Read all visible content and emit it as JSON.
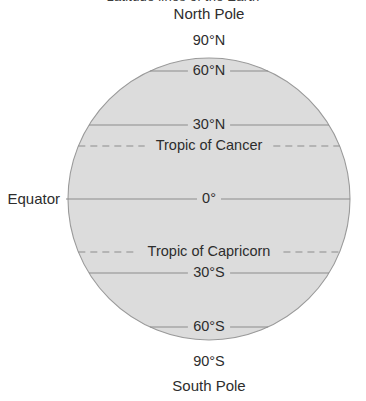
{
  "figure": {
    "cut_off_title": "Latitude lines of the Earth",
    "globe": {
      "fill_color": "#dcdcdc",
      "outline_color": "#9a9a9a",
      "center_x": 209,
      "center_y": 199,
      "radius": 141
    },
    "line_color": "#8c8c8c",
    "text_color": "#2d2d2d"
  },
  "labels": {
    "north_pole": "North Pole",
    "south_pole": "South Pole",
    "equator_side": "Equator"
  },
  "chart_data": {
    "type": "diagram",
    "title": "Latitude lines of the Earth",
    "latitudes": [
      {
        "name": "90N",
        "label": "90°N",
        "y": 41,
        "style": "none",
        "position": "above-globe",
        "degrees": 90
      },
      {
        "name": "60N",
        "label": "60°N",
        "y": 71,
        "style": "solid",
        "position": "inside",
        "degrees": 60
      },
      {
        "name": "30N",
        "label": "30°N",
        "y": 125,
        "style": "solid",
        "position": "inside",
        "degrees": 30
      },
      {
        "name": "cancer",
        "label": "Tropic of Cancer",
        "y": 146,
        "style": "dashed",
        "position": "inside",
        "degrees": 23.5
      },
      {
        "name": "0",
        "label": "0°",
        "y": 199,
        "style": "solid",
        "position": "inside",
        "degrees": 0
      },
      {
        "name": "capricorn",
        "label": "Tropic of Capricorn",
        "y": 252,
        "style": "dashed",
        "position": "inside",
        "degrees": -23.5
      },
      {
        "name": "30S",
        "label": "30°S",
        "y": 273,
        "style": "solid",
        "position": "inside",
        "degrees": -30
      },
      {
        "name": "60S",
        "label": "60°S",
        "y": 327,
        "style": "solid",
        "position": "inside",
        "degrees": -60
      },
      {
        "name": "90S",
        "label": "90°S",
        "y": 362,
        "style": "none",
        "position": "below-globe",
        "degrees": -90
      }
    ]
  }
}
